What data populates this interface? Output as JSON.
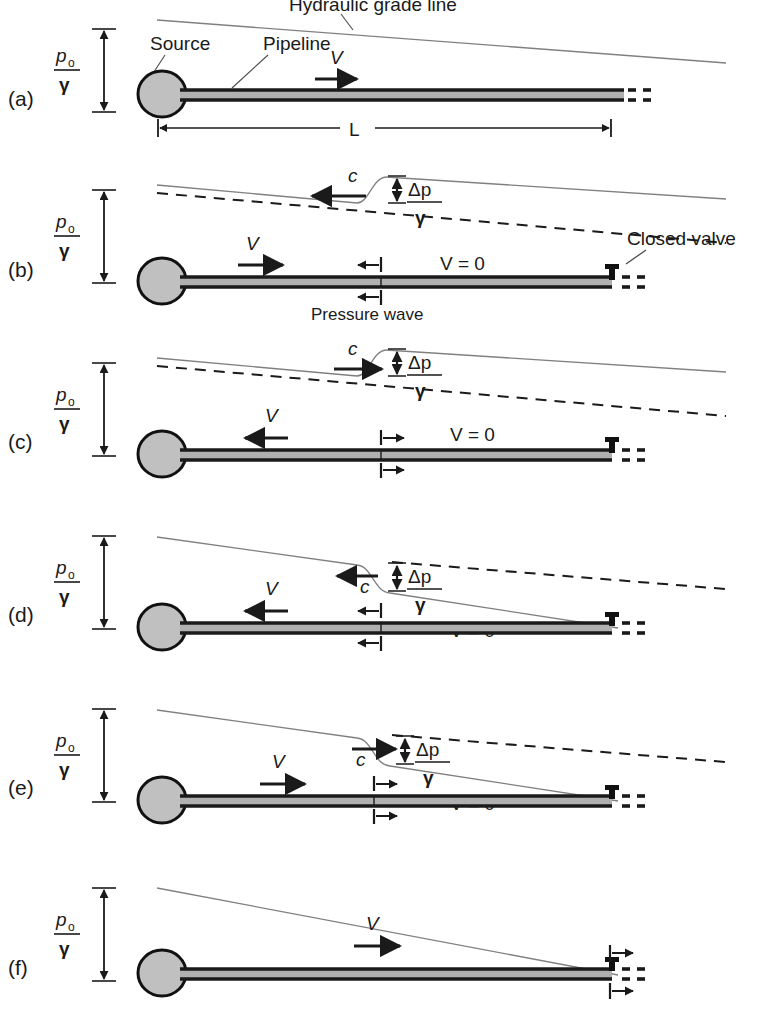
{
  "figure": {
    "type": "technical-schematic",
    "panel_count": 6,
    "colors": {
      "background": "#ffffff",
      "pipe_fill": "#b0b0b0",
      "pipe_outline": "#1a1a1a",
      "source_fill": "#c0c0c0",
      "source_outline": "#111111",
      "hgl_line": "#707070",
      "dashed_line": "#1a1a1a",
      "text": "#1a1a1a",
      "valve": "#111111"
    }
  },
  "common": {
    "head_label_num": "p",
    "head_label_sub": "o",
    "head_label_den": "γ",
    "delta_num": "Δp",
    "delta_den": "γ",
    "v_label": "V",
    "v_zero_label": "V = 0",
    "c_label": "c",
    "length_label": "L"
  },
  "panels": [
    {
      "id": "a",
      "tag": "(a)",
      "state": "Steady flow, valve open",
      "labels": {
        "hydraulic_grade_line": "Hydraulic grade line",
        "source": "Source",
        "pipeline": "Pipeline",
        "velocity": "V",
        "length": "L",
        "head": "pₒ/γ"
      },
      "has_dimension_line": true,
      "has_valve": false,
      "velocity_direction": "right",
      "wave": null
    },
    {
      "id": "b",
      "tag": "(b)",
      "state": "Valve just closed, pressure wave travels upstream",
      "labels": {
        "velocity": "V",
        "velocity_zero": "V = 0",
        "wave_speed": "c",
        "delta_head": "Δp/γ",
        "pressure_wave": "Pressure wave",
        "closed_valve": "Closed valve",
        "head": "pₒ/γ"
      },
      "has_valve": true,
      "velocity_direction": "right",
      "wave": {
        "direction": "left",
        "marker": "left",
        "position_pct": 46
      }
    },
    {
      "id": "c",
      "tag": "(c)",
      "state": "Reflected wave travels downstream, flow reversed",
      "labels": {
        "velocity": "V",
        "velocity_zero": "V = 0",
        "wave_speed": "c",
        "delta_head": "Δp/γ",
        "head": "pₒ/γ"
      },
      "has_valve": true,
      "velocity_direction": "left",
      "wave": {
        "direction": "right",
        "marker": "right",
        "position_pct": 46
      }
    },
    {
      "id": "d",
      "tag": "(d)",
      "state": "Low pressure wave travels upstream",
      "labels": {
        "velocity": "V",
        "velocity_zero": "V = 0",
        "wave_speed": "c",
        "delta_head": "Δp/γ",
        "head": "pₒ/γ"
      },
      "has_valve": true,
      "velocity_direction": "left",
      "wave": {
        "direction": "left",
        "marker": "left",
        "position_pct": 46
      }
    },
    {
      "id": "e",
      "tag": "(e)",
      "state": "Low pressure wave reflected downstream, flow restored",
      "labels": {
        "velocity": "V",
        "velocity_zero": "V = 0",
        "wave_speed": "c",
        "delta_head": "Δp/γ",
        "head": "pₒ/γ"
      },
      "has_valve": true,
      "velocity_direction": "right",
      "wave": {
        "direction": "right",
        "marker": "right",
        "position_pct": 46
      }
    },
    {
      "id": "f",
      "tag": "(f)",
      "state": "Cycle complete, steady flow restored at valve",
      "labels": {
        "velocity": "V",
        "head": "pₒ/γ"
      },
      "has_valve": true,
      "velocity_direction": "right",
      "wave": null,
      "valve_outflow": true
    }
  ]
}
